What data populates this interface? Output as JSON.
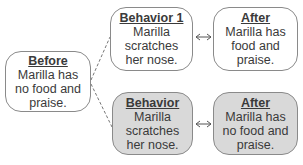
{
  "diagram": {
    "before": {
      "title": "Before",
      "lines": [
        "Marilla has",
        "no food and",
        "praise."
      ]
    },
    "behavior_1": {
      "title": "Behavior 1",
      "lines": [
        "Marilla",
        "scratches",
        "her nose."
      ]
    },
    "after_1": {
      "title": "After",
      "lines": [
        "Marilla has",
        "food and",
        "praise."
      ]
    },
    "behavior_2": {
      "title": "Behavior",
      "lines": [
        "Marilla",
        "scratches",
        "her nose."
      ]
    },
    "after_2": {
      "title": "After",
      "lines": [
        "Marilla has",
        "no food and",
        "praise."
      ]
    }
  },
  "colors": {
    "shaded_fill": "#d9d9d9",
    "border": "#8a8a8a"
  }
}
